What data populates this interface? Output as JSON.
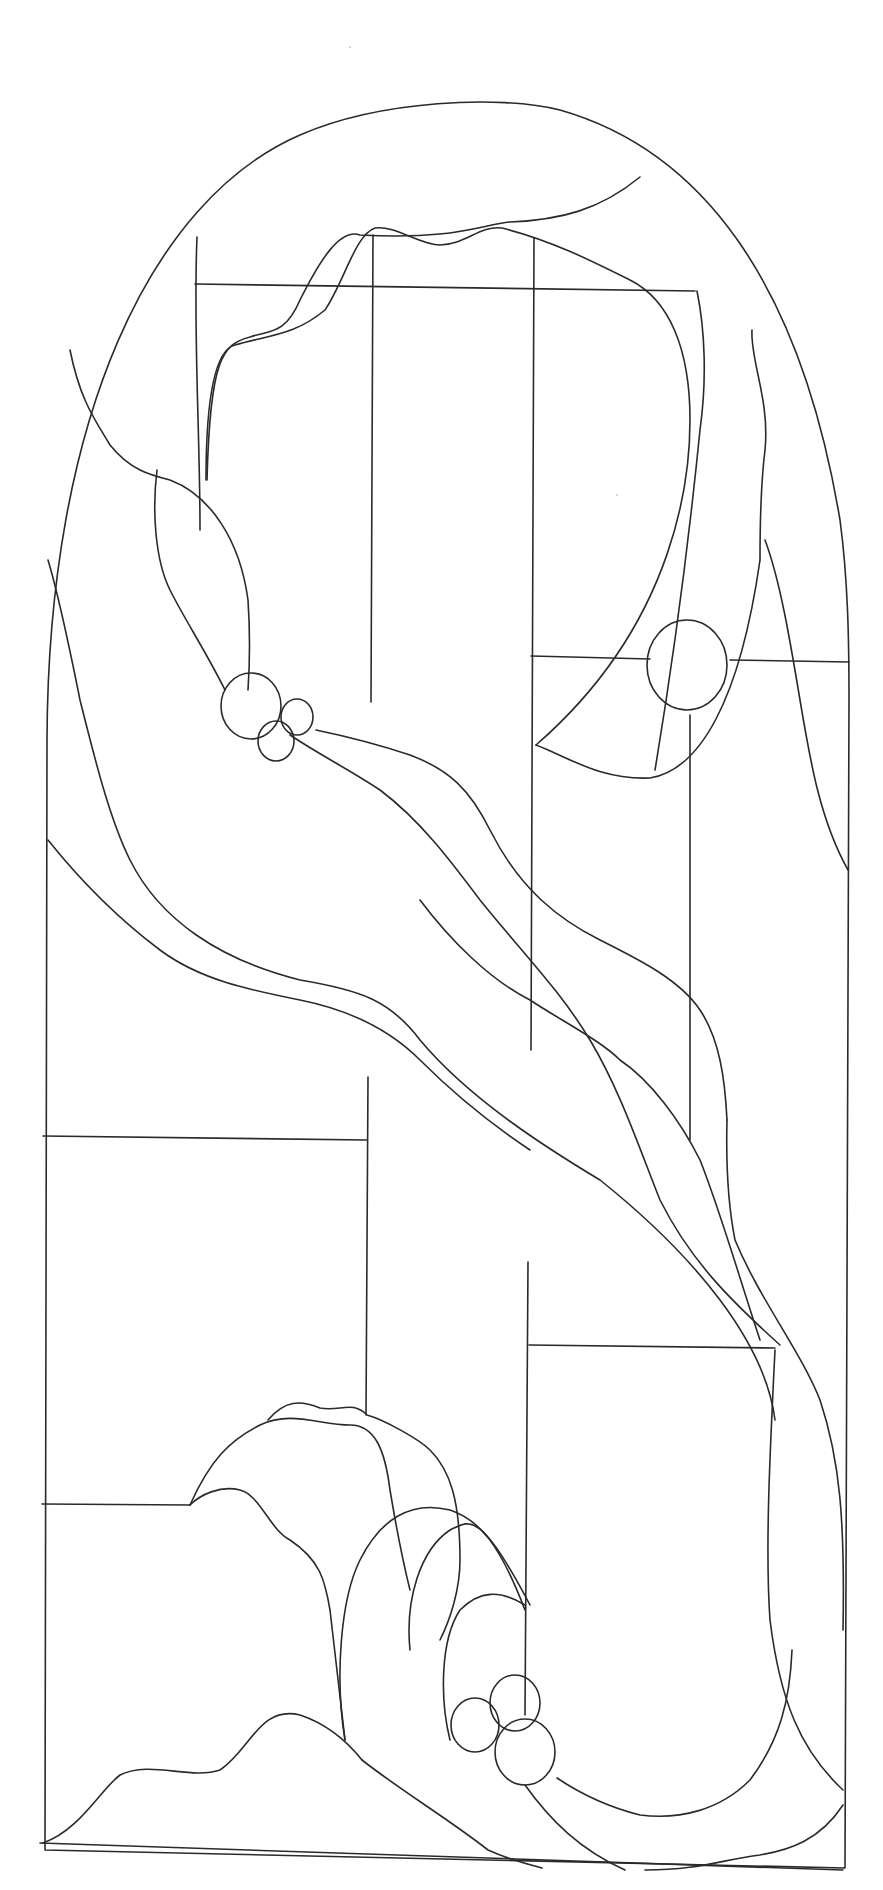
{
  "figure": {
    "background": "#ffffff",
    "stroke_color": "#2a2a2a",
    "frame": {
      "arch": "M45,1850 L47,740 C48,420 150,200 300,135 C380,100 500,95 560,110 C700,150 800,280 840,520 C848,580 849,640 849,700 L845,1868 Z",
      "bottom": "M40,1843 L843,1870"
    },
    "leads": {
      "horizontals": [
        {
          "name": "top-crossbar",
          "d": "M195,284 L695,291"
        },
        {
          "name": "right-upper-bar",
          "d": "M531,656 L650,659 M730,660 L849,662"
        },
        {
          "name": "left-middle-bar",
          "d": "M43,1136 L367,1140"
        },
        {
          "name": "right-lower-bar",
          "d": "M529,1345 L775,1348"
        },
        {
          "name": "left-lower-bar",
          "d": "M42,1504 L190,1505"
        }
      ],
      "verticals": [
        {
          "name": "center-left-stile-upper",
          "d": "M373,235 L371,702"
        },
        {
          "name": "center-left-stile-lower",
          "d": "M368,1077 L366,1415"
        },
        {
          "name": "center-right-stile-upper",
          "d": "M534,238 L531,1050"
        },
        {
          "name": "center-right-stile-lower",
          "d": "M528,1262 L525,1715"
        },
        {
          "name": "right-small-stem",
          "d": "M690,715 L690,1140"
        },
        {
          "name": "top-left-stile",
          "d": "M197,237 C193,330 200,430 200,530"
        }
      ],
      "curves": [
        {
          "name": "top-cloud-outer",
          "d": "M640,177 C600,210 560,220 510,222 C480,225 455,240 360,235 C340,228 320,260 300,300 C285,335 270,330 250,337 C222,344 210,360 207,480"
        },
        {
          "name": "top-cloud-inner",
          "d": "M206,480 C206,400 215,350 235,345 C270,335 295,335 325,310 C345,280 355,235 375,228 C395,225 420,245 440,245 C465,245 480,225 502,228 C550,240 590,260 630,280 C670,300 690,350 690,420 C690,470 680,620 536,745"
        },
        {
          "name": "top-cloud-lower",
          "d": "M536,745 C570,758 600,780 650,778 C700,770 740,700 760,560"
        },
        {
          "name": "top-right-band-outer",
          "d": "M697,291 C705,330 707,380 700,430 C695,480 680,620 655,770"
        },
        {
          "name": "top-right-band-inner",
          "d": "M752,330 C750,360 770,400 765,450 C760,490 760,540 760,560"
        },
        {
          "name": "right-edge-ribbon",
          "d": "M765,540 C780,580 790,640 800,700 C810,760 820,820 848,870"
        },
        {
          "name": "left-ribbon-outer",
          "d": "M48,560 C60,600 70,650 80,700 C95,760 110,820 130,860 C160,920 220,960 300,980 C360,990 390,1000 420,1040 C470,1100 550,1150 600,1180 C650,1220 690,1260 720,1300 C750,1340 770,1380 775,1420"
        },
        {
          "name": "left-ribbon-inner",
          "d": "M48,840 C80,880 120,920 160,950 C200,980 250,990 300,1000 C350,1010 390,1030 420,1060 C460,1100 500,1130 530,1150"
        },
        {
          "name": "upper-left-wavy-a",
          "d": "M70,350 C80,400 95,420 110,445 C130,470 150,475 170,480 C210,495 240,540 248,600 C250,630 250,660 248,690"
        },
        {
          "name": "upper-left-wavy-b",
          "d": "M157,470 C152,510 155,560 170,590 C185,620 205,650 225,690"
        },
        {
          "name": "bubble-band-upper",
          "d": "M316,730 C340,735 380,745 410,755 C450,770 470,790 490,830 C520,890 560,920 600,940 C640,960 680,980 700,1010 C720,1040 725,1080 727,1120"
        },
        {
          "name": "bubble-band-lower",
          "d": "M290,735 C320,755 350,770 380,790 C420,820 450,860 480,900 C520,950 560,990 590,1040 C620,1090 640,1150 660,1200 C690,1260 730,1300 780,1345"
        },
        {
          "name": "center-wave",
          "d": "M420,900 C450,940 490,980 530,1000 C560,1020 600,1040 620,1060 C650,1080 680,1120 700,1160 C720,1210 740,1280 760,1340"
        },
        {
          "name": "right-long-band",
          "d": "M727,1120 C726,1160 727,1200 735,1240 C760,1300 800,1350 820,1400 C840,1460 845,1520 843,1630"
        },
        {
          "name": "right-trunk",
          "d": "M775,1350 C770,1450 765,1550 770,1620 C780,1700 800,1750 843,1790"
        },
        {
          "name": "bottom-right-sweep",
          "d": "M557,1778 C590,1800 620,1810 640,1815 C680,1820 720,1810 750,1780 C780,1740 790,1700 792,1650"
        },
        {
          "name": "bottom-right-hill",
          "d": "M843,1805 C820,1840 790,1850 760,1855 C720,1860 700,1870 645,1870"
        },
        {
          "name": "bottom-left-hills",
          "d": "M43,1843 C80,1830 100,1790 120,1775 C150,1760 190,1780 220,1770 C250,1750 260,1705 300,1715 C330,1725 350,1745 362,1760"
        },
        {
          "name": "bottom-diagonal",
          "d": "M362,1760 C400,1790 450,1820 488,1850 C510,1860 530,1865 542,1868"
        },
        {
          "name": "bottom-inner-diagonal",
          "d": "M525,1785 C550,1820 580,1850 625,1870"
        },
        {
          "name": "hill-outer",
          "d": "M190,1505 C210,1460 230,1440 260,1425 C290,1410 320,1425 350,1425 C375,1425 385,1450 390,1490 C395,1520 400,1550 410,1590"
        },
        {
          "name": "hill-top-scallop",
          "d": "M268,1420 C285,1400 300,1400 320,1408 C340,1412 352,1400 367,1415 C385,1420 420,1440 430,1450 C450,1470 460,1500 460,1560 C460,1590 450,1620 440,1640"
        },
        {
          "name": "hill-inner-step",
          "d": "M190,1505 C200,1495 220,1485 240,1490 C260,1495 270,1530 290,1540 C320,1560 325,1580 330,1610 C335,1650 340,1700 345,1740"
        },
        {
          "name": "swirl-outer",
          "d": "M345,1740 C335,1680 340,1600 360,1560 C380,1520 410,1500 450,1510 C480,1520 500,1545 525,1610"
        },
        {
          "name": "swirl-middle",
          "d": "M410,1650 C405,1600 420,1550 450,1530 C470,1520 480,1510 530,1605"
        },
        {
          "name": "swirl-inner",
          "d": "M450,1740 C440,1700 440,1640 460,1610 C480,1590 500,1590 525,1605"
        }
      ],
      "circles": [
        {
          "name": "upper-left-cluster-large",
          "cx": 251,
          "cy": 706,
          "rx": 30,
          "ry": 33
        },
        {
          "name": "upper-left-cluster-small-a",
          "cx": 297,
          "cy": 717,
          "rx": 16,
          "ry": 18
        },
        {
          "name": "upper-left-cluster-small-b",
          "cx": 276,
          "cy": 741,
          "rx": 18,
          "ry": 20
        },
        {
          "name": "right-sun",
          "cx": 687,
          "cy": 665,
          "rx": 40,
          "ry": 45
        },
        {
          "name": "bottom-cluster-top",
          "cx": 515,
          "cy": 1703,
          "rx": 25,
          "ry": 28
        },
        {
          "name": "bottom-cluster-left",
          "cx": 475,
          "cy": 1725,
          "rx": 24,
          "ry": 27
        },
        {
          "name": "bottom-cluster-right",
          "cx": 525,
          "cy": 1752,
          "rx": 30,
          "ry": 33
        }
      ]
    }
  }
}
